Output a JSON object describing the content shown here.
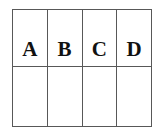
{
  "figure": {
    "background_color": "#ffffff",
    "line_color": "#585858",
    "text_color": "#111111",
    "columns": 4,
    "rows": 2
  },
  "grid": {
    "top_row": {
      "name": "label-row",
      "cells": [
        {
          "label": "A"
        },
        {
          "label": "B"
        },
        {
          "label": "C"
        },
        {
          "label": "D"
        }
      ]
    },
    "bottom_row": {
      "name": "empty-row",
      "cells": [
        {
          "label": ""
        },
        {
          "label": ""
        },
        {
          "label": ""
        },
        {
          "label": ""
        }
      ]
    }
  }
}
